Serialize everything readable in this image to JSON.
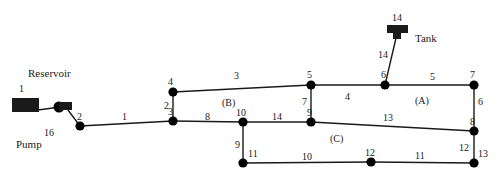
{
  "diagram": {
    "components": [
      {
        "name": "reservoir",
        "label": "Reservoir",
        "x": 28,
        "y": 68
      },
      {
        "name": "pump",
        "label": "Pump",
        "x": 16,
        "y": 139
      },
      {
        "name": "tank",
        "label": "Tank",
        "x": 415,
        "y": 33
      }
    ],
    "zones": [
      {
        "name": "zone-a",
        "label": "(A)",
        "x": 415,
        "y": 96
      },
      {
        "name": "zone-b",
        "label": "(B)",
        "x": 222,
        "y": 98
      },
      {
        "name": "zone-c",
        "label": "(C)",
        "x": 330,
        "y": 134
      }
    ],
    "nodes": [
      {
        "id": "1",
        "label": "1",
        "x": 22,
        "y": 106,
        "shape": "reservoir",
        "lx": 19,
        "ly": 84
      },
      {
        "id": "2",
        "label": "2",
        "x": 80,
        "y": 126,
        "shape": "circle",
        "lx": 77,
        "ly": 112
      },
      {
        "id": "3",
        "label": "3",
        "x": 173,
        "y": 121,
        "shape": "circle",
        "lx": 168,
        "ly": 107
      },
      {
        "id": "4",
        "label": "4",
        "x": 173,
        "y": 92,
        "shape": "circle",
        "lx": 168,
        "ly": 77
      },
      {
        "id": "5",
        "label": "5",
        "x": 311,
        "y": 85,
        "shape": "circle",
        "lx": 307,
        "ly": 70
      },
      {
        "id": "6",
        "label": "6",
        "x": 385,
        "y": 85,
        "shape": "circle",
        "lx": 381,
        "ly": 70
      },
      {
        "id": "7",
        "label": "7",
        "x": 474,
        "y": 85,
        "shape": "circle",
        "lx": 470,
        "ly": 70
      },
      {
        "id": "8",
        "label": "8",
        "x": 474,
        "y": 131,
        "shape": "circle",
        "lx": 470,
        "ly": 117
      },
      {
        "id": "9",
        "label": "9",
        "x": 311,
        "y": 122,
        "shape": "circle",
        "lx": 307,
        "ly": 108
      },
      {
        "id": "10",
        "label": "10",
        "x": 243,
        "y": 122,
        "shape": "circle",
        "lx": 236,
        "ly": 108
      },
      {
        "id": "11",
        "label": "11",
        "x": 243,
        "y": 163,
        "shape": "circle",
        "lx": 248,
        "ly": 149
      },
      {
        "id": "12",
        "label": "12",
        "x": 371,
        "y": 162,
        "shape": "circle",
        "lx": 365,
        "ly": 148
      },
      {
        "id": "13",
        "label": "13",
        "x": 474,
        "y": 163,
        "shape": "circle",
        "lx": 478,
        "ly": 149
      },
      {
        "id": "14",
        "label": "14",
        "x": 397,
        "y": 31,
        "shape": "tank",
        "lx": 392,
        "ly": 13
      }
    ],
    "pipes": [
      {
        "id": "16",
        "label": "16",
        "from": "1",
        "to": "2",
        "lx": 44,
        "ly": 128
      },
      {
        "id": "1",
        "label": "1",
        "from": "2",
        "to": "3",
        "lx": 122,
        "ly": 112
      },
      {
        "id": "2",
        "label": "2",
        "from": "3",
        "to": "4",
        "lx": 164,
        "ly": 101
      },
      {
        "id": "3",
        "label": "3",
        "from": "4",
        "to": "5",
        "lx": 234,
        "ly": 71
      },
      {
        "id": "4",
        "label": "4",
        "from": "5",
        "to": "6",
        "lx": 345,
        "ly": 92
      },
      {
        "id": "5",
        "label": "5",
        "from": "6",
        "to": "7",
        "lx": 430,
        "ly": 72
      },
      {
        "id": "6",
        "label": "6",
        "from": "7",
        "to": "8",
        "lx": 478,
        "ly": 97
      },
      {
        "id": "7",
        "label": "7",
        "from": "5",
        "to": "9",
        "lx": 302,
        "ly": 97
      },
      {
        "id": "8",
        "label": "8",
        "from": "3",
        "to": "10",
        "lx": 205,
        "ly": 112
      },
      {
        "id": "14",
        "label": "14",
        "from": "10",
        "to": "9",
        "lx": 272,
        "ly": 112
      },
      {
        "id": "13",
        "label": "13",
        "from": "9",
        "to": "8",
        "lx": 383,
        "ly": 113
      },
      {
        "id": "9",
        "label": "9",
        "from": "10",
        "to": "11",
        "lx": 235,
        "ly": 140
      },
      {
        "id": "10",
        "label": "10",
        "from": "11",
        "to": "12",
        "lx": 302,
        "ly": 152
      },
      {
        "id": "11",
        "label": "11",
        "from": "12",
        "to": "13",
        "lx": 415,
        "ly": 151
      },
      {
        "id": "12",
        "label": "12",
        "from": "8",
        "to": "13",
        "lx": 459,
        "ly": 143
      },
      {
        "id": "15",
        "label": "14",
        "from": "14",
        "to": "6",
        "lx": 378,
        "ly": 50
      }
    ],
    "colors": {
      "line": "#1a1a1a",
      "node": "#000000",
      "text": "#1a1a1a",
      "background": "#ffffff"
    }
  }
}
